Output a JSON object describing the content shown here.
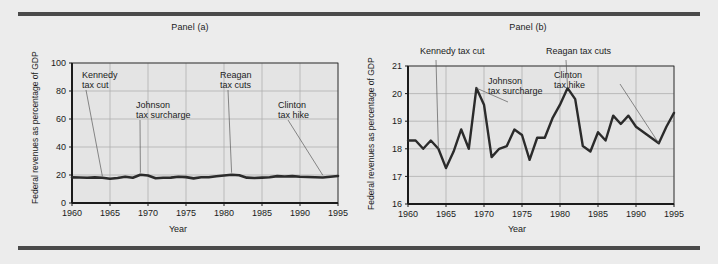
{
  "figure": {
    "background_color": "#ececec",
    "rule_color": "#4a4a4a",
    "line_color": "#2b2b2b",
    "grid_color": "#a9a9a9",
    "axis_color": "#1b1b1b",
    "plot_bg_color": "#e4e4e4"
  },
  "panel_a": {
    "title": "Panel (a)",
    "ylabel": "Federal revenues as percentage of GDP",
    "xlabel": "Year",
    "annotations": [
      {
        "name": "kennedy",
        "line1": "Kennedy",
        "line2": "tax cut"
      },
      {
        "name": "johnson",
        "line1": "Johnson",
        "line2": "tax surcharge"
      },
      {
        "name": "reagan",
        "line1": "Reagan",
        "line2": "tax cuts"
      },
      {
        "name": "clinton",
        "line1": "Clinton",
        "line2": "tax hike"
      }
    ]
  },
  "panel_b": {
    "title": "Panel (b)",
    "ylabel": "Federal revenues as percentage of GDP",
    "xlabel": "Year",
    "annotations": [
      {
        "name": "kennedy",
        "line1": "Kennedy tax cut",
        "line2": ""
      },
      {
        "name": "johnson",
        "line1": "Johnson",
        "line2": "tax surcharge"
      },
      {
        "name": "reagan",
        "line1": "Reagan tax cuts",
        "line2": ""
      },
      {
        "name": "clinton",
        "line1": "Clinton",
        "line2": "tax hike"
      }
    ]
  },
  "chart_data": [
    {
      "id": "panel-a",
      "type": "line",
      "title": "Panel (a)",
      "xlabel": "Year",
      "ylabel": "Federal revenues as percentage of GDP",
      "xlim": [
        1960,
        1995
      ],
      "ylim": [
        0,
        100
      ],
      "yticks": [
        0,
        20,
        40,
        60,
        80,
        100
      ],
      "xticks": [
        1960,
        1965,
        1970,
        1975,
        1980,
        1985,
        1990,
        1995
      ],
      "grid": true,
      "legend": "none",
      "annotations": [
        {
          "label": "Kennedy tax cut",
          "x": 1964,
          "y": 17.6
        },
        {
          "label": "Johnson tax surcharge",
          "x": 1969,
          "y": 20.2
        },
        {
          "label": "Reagan tax cuts",
          "x": 1981,
          "y": 20.2
        },
        {
          "label": "Clinton tax hike",
          "x": 1993,
          "y": 18.4
        }
      ],
      "x": [
        1960,
        1961,
        1962,
        1963,
        1964,
        1965,
        1966,
        1967,
        1968,
        1969,
        1970,
        1971,
        1972,
        1973,
        1974,
        1975,
        1976,
        1977,
        1978,
        1979,
        1980,
        1981,
        1982,
        1983,
        1984,
        1985,
        1986,
        1987,
        1988,
        1989,
        1990,
        1991,
        1992,
        1993,
        1994,
        1995
      ],
      "values": [
        18.3,
        18.2,
        18.0,
        18.3,
        18.0,
        17.3,
        17.9,
        18.7,
        18.0,
        20.2,
        19.6,
        17.7,
        18.0,
        18.1,
        18.7,
        18.5,
        17.6,
        18.4,
        18.4,
        19.1,
        19.6,
        20.2,
        19.8,
        18.1,
        17.9,
        18.1,
        18.4,
        19.2,
        18.9,
        19.2,
        18.8,
        18.6,
        18.4,
        18.2,
        18.8,
        19.3
      ]
    },
    {
      "id": "panel-b",
      "type": "line",
      "title": "Panel (b)",
      "xlabel": "Year",
      "ylabel": "Federal revenues as percentage of GDP",
      "xlim": [
        1960,
        1995
      ],
      "ylim": [
        16,
        21
      ],
      "yticks": [
        16,
        17,
        18,
        19,
        20,
        21
      ],
      "xticks": [
        1960,
        1965,
        1970,
        1975,
        1980,
        1985,
        1990,
        1995
      ],
      "grid": true,
      "legend": "none",
      "annotations": [
        {
          "label": "Kennedy tax cut",
          "x": 1964,
          "y": 18.0
        },
        {
          "label": "Johnson tax surcharge",
          "x": 1969,
          "y": 20.2
        },
        {
          "label": "Reagan tax cuts",
          "x": 1981,
          "y": 20.2
        },
        {
          "label": "Clinton tax hike",
          "x": 1993,
          "y": 18.2
        }
      ],
      "x": [
        1960,
        1961,
        1962,
        1963,
        1964,
        1965,
        1966,
        1967,
        1968,
        1969,
        1970,
        1971,
        1972,
        1973,
        1974,
        1975,
        1976,
        1977,
        1978,
        1979,
        1980,
        1981,
        1982,
        1983,
        1984,
        1985,
        1986,
        1987,
        1988,
        1989,
        1990,
        1991,
        1992,
        1993,
        1994,
        1995
      ],
      "values": [
        18.3,
        18.3,
        18.0,
        18.3,
        18.0,
        17.3,
        17.9,
        18.7,
        18.0,
        20.2,
        19.6,
        17.7,
        18.0,
        18.1,
        18.7,
        18.5,
        17.6,
        18.4,
        18.4,
        19.1,
        19.6,
        20.2,
        19.8,
        18.1,
        17.9,
        18.6,
        18.3,
        19.2,
        18.9,
        19.2,
        18.8,
        18.6,
        18.4,
        18.2,
        18.8,
        19.3
      ]
    }
  ]
}
